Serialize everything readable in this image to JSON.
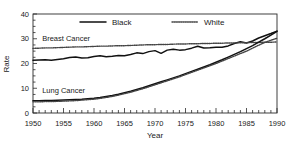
{
  "chart_data": {
    "type": "line",
    "title": "",
    "xlabel": "Year",
    "ylabel": "Rate",
    "xlim": [
      1950,
      1990
    ],
    "ylim": [
      0,
      40
    ],
    "xticks": [
      1950,
      1955,
      1960,
      1965,
      1970,
      1975,
      1980,
      1985,
      1990
    ],
    "yticks": [
      0,
      10,
      20,
      30,
      40
    ],
    "xtick_labels": [
      "1950",
      "1955",
      "1960",
      "1965",
      "1970",
      "1975",
      "1980",
      "1985",
      "1990"
    ],
    "ytick_labels": [
      "0",
      "10",
      "20",
      "30",
      "40"
    ],
    "grid": false,
    "legend_position": "top-center",
    "legend": [
      {
        "label": "Black",
        "style": "solid",
        "color": "#111111"
      },
      {
        "label": "White",
        "style": "dotted",
        "color": "#444444"
      }
    ],
    "annotations": [
      {
        "text": "Breast Cancer",
        "x": 1951.5,
        "y": 29.2
      },
      {
        "text": "Lung Cancer",
        "x": 1951.5,
        "y": 8.0
      }
    ],
    "x": [
      1950,
      1951,
      1952,
      1953,
      1954,
      1955,
      1956,
      1957,
      1958,
      1959,
      1960,
      1961,
      1962,
      1963,
      1964,
      1965,
      1966,
      1967,
      1968,
      1969,
      1970,
      1971,
      1972,
      1973,
      1974,
      1975,
      1976,
      1977,
      1978,
      1979,
      1980,
      1981,
      1982,
      1983,
      1984,
      1985,
      1986,
      1987,
      1988,
      1989,
      1990
    ],
    "series": [
      {
        "name": "Breast Cancer - Black",
        "group": "Breast Cancer",
        "race": "Black",
        "style": "solid",
        "color": "#111111",
        "values": [
          21.3,
          21.4,
          21.5,
          21.3,
          21.6,
          21.9,
          22.4,
          22.6,
          22.2,
          22.3,
          22.8,
          23.1,
          22.7,
          22.9,
          23.2,
          23.1,
          23.6,
          24.3,
          24.0,
          24.8,
          25.2,
          24.1,
          25.4,
          25.8,
          25.4,
          25.6,
          26.2,
          27.0,
          26.3,
          26.4,
          26.6,
          26.6,
          27.1,
          28.1,
          28.8,
          28.3,
          29.1,
          30.3,
          31.2,
          32.1,
          33.1
        ]
      },
      {
        "name": "Breast Cancer - White",
        "group": "Breast Cancer",
        "race": "White",
        "style": "dotted",
        "color": "#444444",
        "values": [
          26.1,
          26.2,
          26.3,
          26.3,
          26.4,
          26.5,
          26.6,
          26.7,
          26.7,
          26.8,
          26.9,
          27.0,
          27.0,
          27.1,
          27.2,
          27.2,
          27.3,
          27.4,
          27.5,
          27.6,
          27.6,
          27.7,
          27.7,
          27.8,
          27.9,
          27.9,
          28.0,
          28.0,
          28.1,
          28.1,
          28.2,
          28.2,
          28.3,
          28.3,
          28.4,
          28.4,
          28.5,
          28.5,
          28.6,
          28.6,
          28.7
        ]
      },
      {
        "name": "Lung Cancer - Black",
        "group": "Lung Cancer",
        "race": "Black",
        "style": "solid",
        "color": "#111111",
        "values": [
          5.0,
          5.0,
          5.1,
          5.1,
          5.2,
          5.3,
          5.4,
          5.5,
          5.6,
          5.8,
          6.0,
          6.3,
          6.7,
          7.1,
          7.6,
          8.2,
          8.8,
          9.5,
          10.2,
          11.0,
          11.8,
          12.6,
          13.4,
          14.2,
          15.0,
          15.9,
          16.8,
          17.7,
          18.6,
          19.5,
          20.5,
          21.5,
          22.6,
          23.7,
          24.8,
          26.0,
          27.2,
          28.6,
          30.0,
          31.5,
          33.0
        ]
      },
      {
        "name": "Lung Cancer - White",
        "group": "Lung Cancer",
        "race": "White",
        "style": "dotted",
        "color": "#444444",
        "values": [
          4.5,
          4.5,
          4.6,
          4.6,
          4.7,
          4.8,
          4.9,
          5.0,
          5.2,
          5.4,
          5.6,
          5.9,
          6.3,
          6.7,
          7.2,
          7.8,
          8.4,
          9.1,
          9.8,
          10.6,
          11.4,
          12.2,
          13.0,
          13.8,
          14.6,
          15.5,
          16.4,
          17.3,
          18.2,
          19.1,
          20.0,
          21.0,
          22.0,
          23.0,
          24.0,
          25.0,
          26.2,
          27.4,
          28.5,
          29.4,
          30.2
        ]
      }
    ]
  },
  "plot": {
    "left": 33,
    "right": 277,
    "top": 14,
    "bottom": 113
  }
}
